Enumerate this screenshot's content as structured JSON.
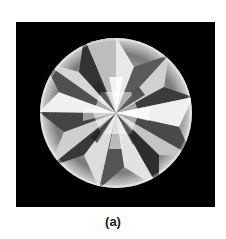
{
  "figure": {
    "caption": "(a)",
    "background_color": "#000000",
    "page_color": "#ffffff"
  }
}
